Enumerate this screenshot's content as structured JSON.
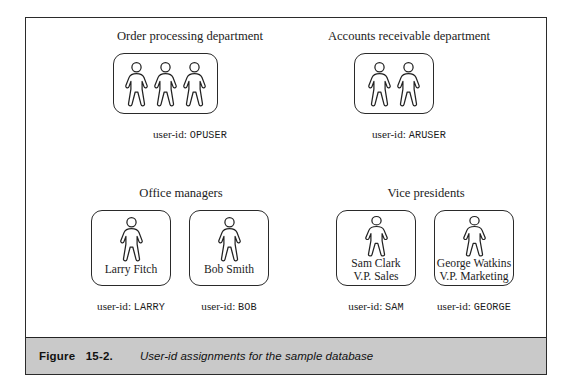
{
  "figure": {
    "number_word": "Figure",
    "number": "15-2.",
    "caption": "User-id assignments for the sample database",
    "caption_bar_color": "#c9c9c9",
    "frame_color": "#2b2b2b"
  },
  "diagram": {
    "icon_name": "person-icon",
    "userid_label": "user-id:",
    "groups": [
      {
        "key": "order-processing",
        "heading": "Order processing department",
        "boxes": [
          {
            "key": "opuser",
            "person_count": 3,
            "name_lines": [],
            "userid": "OPUSER"
          }
        ]
      },
      {
        "key": "accounts-receivable",
        "heading": "Accounts receivable department",
        "boxes": [
          {
            "key": "aruser",
            "person_count": 2,
            "name_lines": [],
            "userid": "ARUSER"
          }
        ]
      },
      {
        "key": "office-managers",
        "heading": "Office managers",
        "boxes": [
          {
            "key": "larry",
            "person_count": 1,
            "name_lines": [
              "Larry Fitch"
            ],
            "userid": "LARRY"
          },
          {
            "key": "bob",
            "person_count": 1,
            "name_lines": [
              "Bob Smith"
            ],
            "userid": "BOB"
          }
        ]
      },
      {
        "key": "vice-presidents",
        "heading": "Vice presidents",
        "boxes": [
          {
            "key": "sam",
            "person_count": 1,
            "name_lines": [
              "Sam Clark",
              "V.P. Sales"
            ],
            "userid": "SAM"
          },
          {
            "key": "george",
            "person_count": 1,
            "name_lines": [
              "George Watkins",
              "V.P. Marketing"
            ],
            "userid": "GEORGE"
          }
        ]
      }
    ]
  }
}
